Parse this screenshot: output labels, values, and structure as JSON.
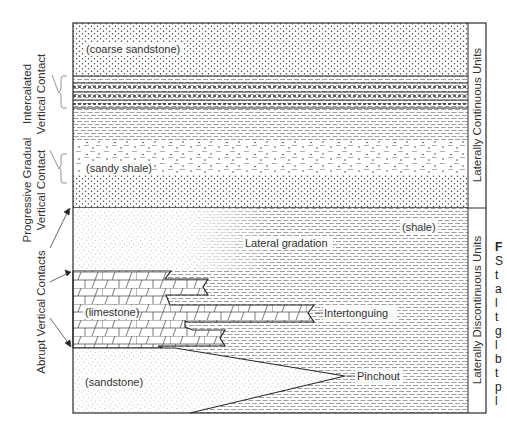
{
  "diagram": {
    "colors": {
      "line": "#2a2a2a",
      "pattern": "#555555",
      "text": "#333333",
      "background": "#ffffff"
    },
    "units": {
      "coarse_sandstone": "(coarse sandstone)",
      "sandy_shale": "(sandy shale)",
      "shale": "(shale)",
      "limestone": "(limestone)",
      "sandstone": "(sandstone)"
    },
    "annotations": {
      "lateral_gradation": "Lateral gradation",
      "intertonguing": "Intertonguing",
      "pinchout": "Pinchout"
    },
    "left_labels": {
      "intercalated_line1": "Intercalated",
      "intercalated_line2": "Vertical Contact",
      "progressive_line1": "Progressive Gradual",
      "progressive_line2": "Vertical Contact",
      "abrupt": "Abrupt Vertical Contacts"
    },
    "right_labels": {
      "continuous": "Laterally Continuous Units",
      "discontinuous": "Laterally Discontinuous Units"
    },
    "caption_fragment": [
      "F",
      "S",
      "t",
      "a",
      "l",
      "t",
      "g",
      "l",
      "b",
      "t",
      "p",
      "l"
    ]
  }
}
